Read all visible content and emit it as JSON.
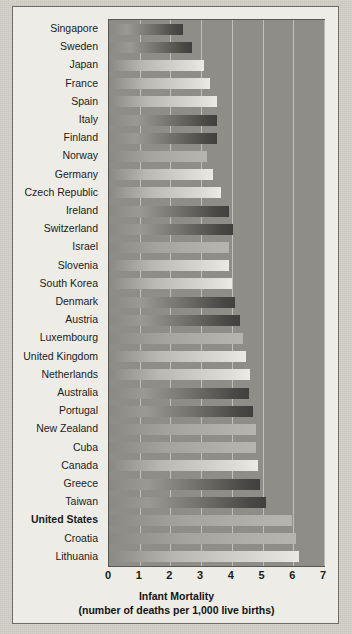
{
  "chart_data": {
    "type": "bar",
    "orientation": "horizontal",
    "title": "Infant Mortality",
    "subtitle": "(number of deaths per 1,000 live births)",
    "xlabel": "Infant Mortality",
    "ylabel": "",
    "xlim": [
      0,
      7
    ],
    "xticks": [
      "0",
      "1",
      "2",
      "3",
      "4",
      "5",
      "6",
      "7"
    ],
    "grid": true,
    "legend": "none",
    "highlighted_category": "United States",
    "categories": [
      "Singapore",
      "Sweden",
      "Japan",
      "France",
      "Spain",
      "Italy",
      "Finland",
      "Norway",
      "Germany",
      "Czech Republic",
      "Ireland",
      "Switzerland",
      "Israel",
      "Slovenia",
      "South Korea",
      "Denmark",
      "Austria",
      "Luxembourg",
      "United Kingdom",
      "Netherlands",
      "Australia",
      "Portugal",
      "New Zealand",
      "Cuba",
      "Canada",
      "Greece",
      "Taiwan",
      "United States",
      "Croatia",
      "Lithuania"
    ],
    "values": [
      2.4,
      2.7,
      3.1,
      3.3,
      3.5,
      3.5,
      3.5,
      3.2,
      3.4,
      3.65,
      3.9,
      4.05,
      3.9,
      3.9,
      4.0,
      4.1,
      4.25,
      4.35,
      4.45,
      4.6,
      4.55,
      4.7,
      4.8,
      4.8,
      4.85,
      4.9,
      5.1,
      5.95,
      6.1,
      6.2
    ],
    "bar_shades": [
      "dark",
      "dark",
      "light",
      "light",
      "light",
      "dark",
      "dark",
      "mid",
      "light",
      "light",
      "dark",
      "dark",
      "mid",
      "light",
      "light",
      "dark",
      "dark",
      "mid",
      "light",
      "light",
      "dark",
      "dark",
      "mid",
      "mid",
      "light",
      "dark",
      "dark",
      "mid",
      "mid",
      "light"
    ]
  }
}
